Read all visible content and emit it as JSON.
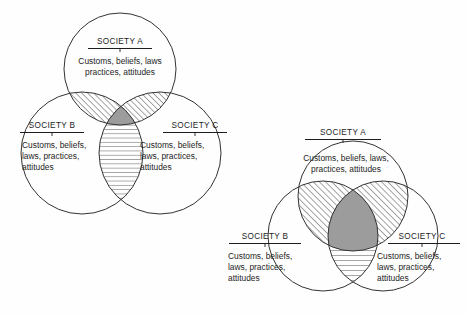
{
  "figure": {
    "caption": "",
    "background_color": "#fefefe",
    "ink_color": "#1d1d1d",
    "shared_fill_color": "#9c9c9c"
  },
  "diagrams": [
    {
      "id": "left-diagram",
      "name": "low-overlap-venn",
      "description": "Three society circles with small overlaps",
      "societies": [
        {
          "key": "A",
          "title": "SOCIETY A",
          "lines": [
            "Customs, beliefs, laws",
            "practices, attitudes"
          ]
        },
        {
          "key": "B",
          "title": "SOCIETY B",
          "lines": [
            "Customs, beliefs,",
            "laws, practices,",
            "attitudes"
          ]
        },
        {
          "key": "C",
          "title": "SOCIETY C",
          "lines": [
            "Customs, beliefs,",
            "laws, practices,",
            "attitudes"
          ]
        }
      ],
      "regions": [
        {
          "key": "AB",
          "fill": "diagonal-hatch"
        },
        {
          "key": "AC",
          "fill": "diagonal-hatch"
        },
        {
          "key": "BC",
          "fill": "horizontal-hatch"
        },
        {
          "key": "ABC",
          "fill": "solid-gray"
        }
      ]
    },
    {
      "id": "right-diagram",
      "name": "high-overlap-venn",
      "description": "Three society circles with large overlaps",
      "societies": [
        {
          "key": "A",
          "title": "SOCIETY A",
          "lines": [
            "Customs, beliefs, laws,",
            "practices, attitudes"
          ]
        },
        {
          "key": "B",
          "title": "SOCIETY B",
          "lines": [
            "Customs, beliefs,",
            "laws, practices,",
            "attitudes"
          ]
        },
        {
          "key": "C",
          "title": "SOCIETY C",
          "lines": [
            "Customs, beliefs,",
            "laws, practices,",
            "attitudes"
          ]
        }
      ],
      "regions": [
        {
          "key": "AB",
          "fill": "diagonal-hatch"
        },
        {
          "key": "AC",
          "fill": "diagonal-hatch"
        },
        {
          "key": "BC",
          "fill": "horizontal-hatch"
        },
        {
          "key": "ABC",
          "fill": "solid-gray"
        }
      ]
    }
  ]
}
